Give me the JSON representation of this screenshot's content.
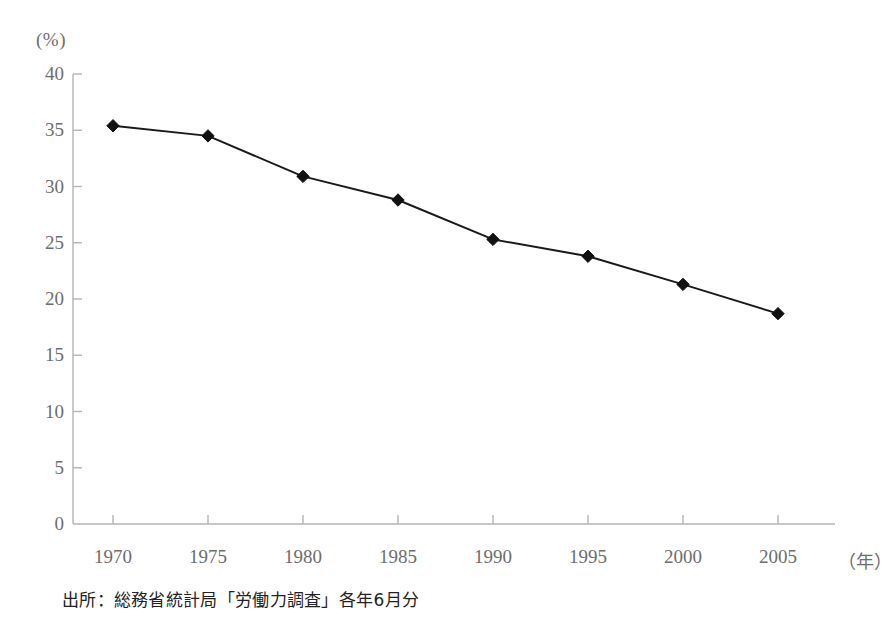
{
  "chart_data": {
    "type": "line",
    "title": "",
    "subtitle": "",
    "xlabel": "(年)",
    "ylabel": "(%)",
    "categories": [
      1970,
      1975,
      1980,
      1985,
      1990,
      1995,
      2000,
      2005
    ],
    "x_tick_labels": [
      "1970",
      "1975",
      "1980",
      "1985",
      "1990",
      "1995",
      "2000",
      "2005"
    ],
    "y_tick_labels": [
      "0",
      "5",
      "10",
      "15",
      "20",
      "25",
      "30",
      "35",
      "40"
    ],
    "y_ticks": [
      0,
      5,
      10,
      15,
      20,
      25,
      30,
      35,
      40
    ],
    "values": [
      35.4,
      34.5,
      30.9,
      28.8,
      25.3,
      23.8,
      21.3,
      18.7
    ],
    "series": [
      {
        "name": "",
        "values": [
          35.4,
          34.5,
          30.9,
          28.8,
          25.3,
          23.8,
          21.3,
          18.7
        ]
      }
    ],
    "xlim": [
      1967.5,
      2007.5
    ],
    "ylim": [
      0,
      40
    ],
    "grid": false,
    "legend": false,
    "legend_position": "none",
    "marker": "diamond",
    "line_color": "#1a1a1a",
    "marker_color": "#111111",
    "axis_color": "#b5b5b5",
    "tick_label_color": "#6d6d6d",
    "annotations": []
  },
  "figure": {
    "source_note": "出所：総務省統計局「労働力調査」各年6月分",
    "y_axis_unit": "(%)",
    "x_axis_unit": "（年）",
    "background_color": "#ffffff"
  }
}
